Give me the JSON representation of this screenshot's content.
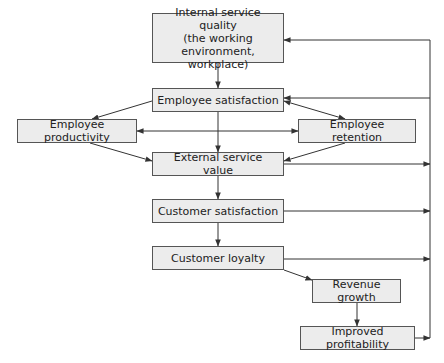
{
  "diagram": {
    "type": "flowchart",
    "nodes": {
      "internal_service_quality": {
        "label": "Internal service quality\n(the working\nenvironment, workplace)"
      },
      "employee_satisfaction": {
        "label": "Employee satisfaction"
      },
      "employee_productivity": {
        "label": "Employee productivity"
      },
      "employee_retention": {
        "label": "Employee retention"
      },
      "external_service_value": {
        "label": "External service value"
      },
      "customer_satisfaction": {
        "label": "Customer satisfaction"
      },
      "customer_loyalty": {
        "label": "Customer loyalty"
      },
      "revenue_growth": {
        "label": "Revenue growth"
      },
      "improved_profitability": {
        "label": "Improved profitability"
      }
    },
    "edges": [
      {
        "from": "internal_service_quality",
        "to": "employee_satisfaction"
      },
      {
        "from": "employee_satisfaction",
        "to": "employee_productivity"
      },
      {
        "from": "employee_satisfaction",
        "to": "employee_retention",
        "bidirectional": true
      },
      {
        "from": "employee_satisfaction",
        "to": "external_service_value"
      },
      {
        "from": "employee_productivity",
        "to": "employee_retention",
        "bidirectional": true
      },
      {
        "from": "employee_productivity",
        "to": "external_service_value"
      },
      {
        "from": "employee_retention",
        "to": "external_service_value"
      },
      {
        "from": "external_service_value",
        "to": "customer_satisfaction"
      },
      {
        "from": "customer_satisfaction",
        "to": "customer_loyalty"
      },
      {
        "from": "customer_loyalty",
        "to": "revenue_growth"
      },
      {
        "from": "revenue_growth",
        "to": "improved_profitability"
      },
      {
        "from": "external_service_value",
        "to": "feedback_loop"
      },
      {
        "from": "customer_satisfaction",
        "to": "feedback_loop"
      },
      {
        "from": "customer_loyalty",
        "to": "feedback_loop"
      },
      {
        "from": "improved_profitability",
        "to": "feedback_loop"
      },
      {
        "from": "feedback_loop",
        "to": "internal_service_quality"
      },
      {
        "from": "feedback_loop",
        "to": "employee_satisfaction"
      }
    ],
    "colors": {
      "node_fill": "#ececec",
      "node_border": "#555555",
      "line": "#333333",
      "text": "#222222"
    }
  }
}
